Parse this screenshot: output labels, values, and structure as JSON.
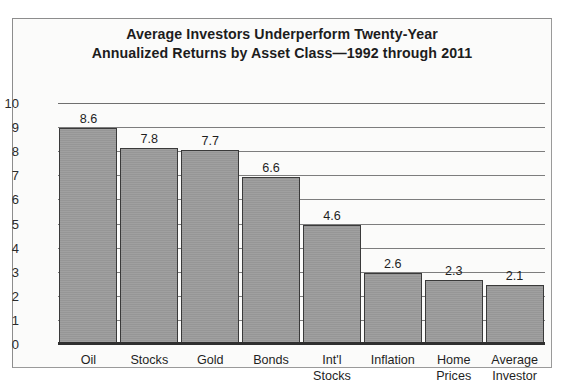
{
  "chart_data": {
    "type": "bar",
    "title": "Average Investors Underperform Twenty-Year Annualized Returns by Asset Class—1992 through 2011",
    "title_lines": [
      "Average Investors Underperform Twenty-Year",
      "Annualized Returns by Asset Class—1992 through 2011"
    ],
    "categories": [
      "Oil",
      "Stocks",
      "Gold",
      "Bonds",
      "Int'l Stocks",
      "Inflation",
      "Home Prices",
      "Average Investor"
    ],
    "category_lines": [
      [
        "Oil"
      ],
      [
        "Stocks"
      ],
      [
        "Gold"
      ],
      [
        "Bonds"
      ],
      [
        "Int'l",
        "Stocks"
      ],
      [
        "Inflation"
      ],
      [
        "Home",
        "Prices"
      ],
      [
        "Average",
        "Investor"
      ]
    ],
    "values": [
      8.6,
      7.8,
      7.7,
      6.6,
      4.6,
      2.6,
      2.3,
      2.1
    ],
    "value_labels": [
      "8.6",
      "7.8",
      "7.7",
      "6.6",
      "4.6",
      "2.6",
      "2.3",
      "2.1"
    ],
    "xlabel": "",
    "ylabel": "",
    "ylim": [
      0,
      10
    ],
    "yticks": [
      0,
      1,
      2,
      3,
      4,
      5,
      6,
      7,
      8,
      9,
      10
    ],
    "ytick_labels": [
      "0",
      "1",
      "2",
      "3",
      "4",
      "5",
      "6",
      "7",
      "8",
      "9",
      "10"
    ],
    "grid": true,
    "legend": false,
    "series_color": "#9b9b9b",
    "bar_border_color": "#3a3a3a",
    "gridline_color": "#7d7d7d",
    "axis_color": "#2f2f2f",
    "background_color": "#fbfbfa",
    "frame_color": "#8d8d8d"
  }
}
